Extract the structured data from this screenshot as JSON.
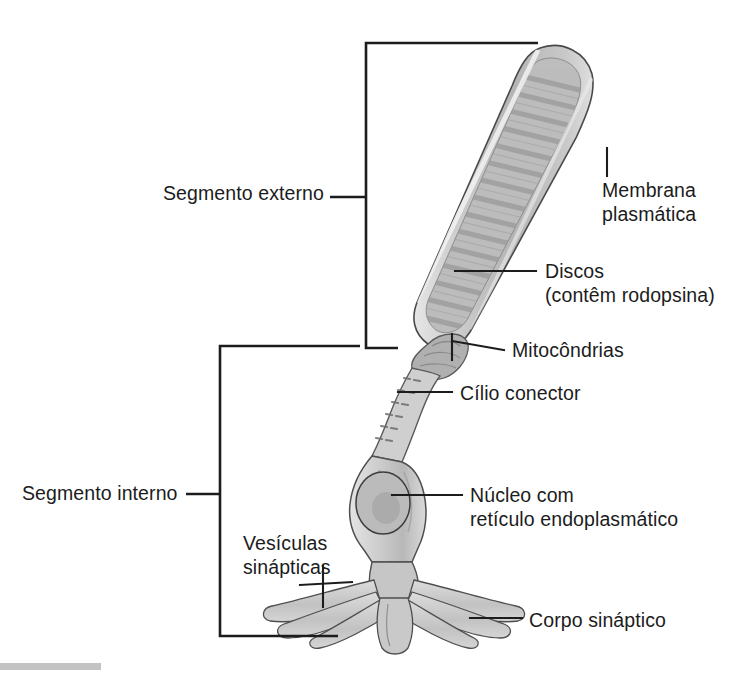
{
  "figure": {
    "background_color": "#ffffff",
    "line_color": "#1c1c1c",
    "cell_fill_light": "#d8d8d8",
    "cell_fill_mid": "#bdbdbd",
    "cell_fill_dark": "#9e9e9e",
    "disc_color": "#a8a8a8"
  },
  "brackets": [
    {
      "id": "outer-segment-bracket",
      "label": "Segmento externo",
      "label_x": 163,
      "label_y": 181,
      "spine_x": 366,
      "top_y": 43,
      "bottom_y": 348,
      "arm_top_x": 538,
      "arm_bottom_x": 398,
      "tick_y": 197,
      "tick_x": 330
    },
    {
      "id": "inner-segment-bracket",
      "label": "Segmento interno",
      "label_x": 22,
      "label_y": 481,
      "spine_x": 220,
      "top_y": 346,
      "bottom_y": 636,
      "arm_top_x": 360,
      "arm_bottom_x": 338,
      "tick_y": 494,
      "tick_x": 186
    }
  ],
  "callouts": [
    {
      "id": "membrana-plasmatica",
      "text": "Membrana\nplasmática",
      "text_x": 602,
      "text_y": 178,
      "leader": "M607,148 L607,176"
    },
    {
      "id": "discos",
      "text": "Discos\n(contêm rodopsina)",
      "text_x": 545,
      "text_y": 259,
      "leader": "M455,271 L536,271"
    },
    {
      "id": "mitocondrias",
      "text": "Mitocôndrias",
      "text_x": 512,
      "text_y": 338,
      "leader": "M452,341 L504,350 M452,341 L452,363"
    },
    {
      "id": "cilio-conector",
      "text": "Cílio conector",
      "text_x": 460,
      "text_y": 381,
      "leader": "M398,392 L452,392"
    },
    {
      "id": "nucleo",
      "text": "Núcleo com\nretículo endoplasmático",
      "text_x": 470,
      "text_y": 483,
      "leader": "M394,495 L462,495"
    },
    {
      "id": "vesiculas-sinapticas",
      "text": "Vesículas\nsinápticas",
      "text_x": 243,
      "text_y": 531,
      "leader": "M300,585 L349,585 M323,568 L323,605"
    },
    {
      "id": "corpo-sinaptico",
      "text": "Corpo sináptico",
      "text_x": 529,
      "text_y": 608,
      "leader": "M470,618 L522,618"
    }
  ]
}
